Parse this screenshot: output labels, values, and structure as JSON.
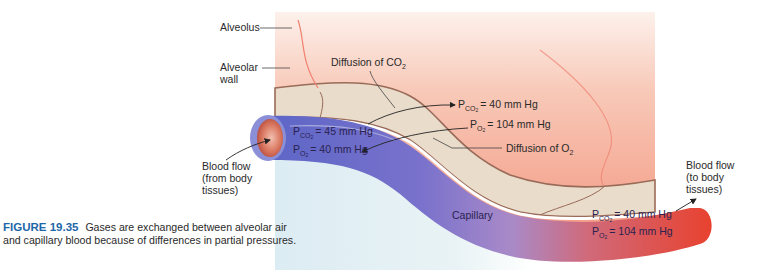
{
  "figure": {
    "number_label": "FIGURE 19.35",
    "caption_text": "Gases are exchanged between alveolar air and capillary blood because of differences in partial pressures."
  },
  "labels": {
    "alveolus": "Alveolus",
    "alveolar_wall_line1": "Alveolar",
    "alveolar_wall_line2": "wall",
    "diffusion_co2": "Diffusion of CO",
    "diffusion_o2": "Diffusion of O",
    "sub2": "2",
    "blood_flow_in_line1": "Blood flow",
    "blood_flow_in_line2": "(from body",
    "blood_flow_in_line3": "tissues)",
    "blood_flow_out_line1": "Blood flow",
    "blood_flow_out_line2": "(to body",
    "blood_flow_out_line3": "tissues)",
    "capillary": "Capillary"
  },
  "pressures": {
    "P": "P",
    "co2_sub": "CO",
    "o2_sub": "O",
    "sub2": "2",
    "alveolar_pco2": "= 40 mm Hg",
    "alveolar_po2": "= 104 mm Hg",
    "venous_pco2": "= 45 mm Hg",
    "venous_po2": "= 40 mm Hg",
    "arterial_pco2": "= 40 mm Hg",
    "arterial_po2": "= 104 mm Hg"
  },
  "colors": {
    "alveolus_pink": "#f4a48e",
    "wall_beige": "#e9dccb",
    "wall_outline": "#9a6b58",
    "deoxygenated_blue": "#6f6fc8",
    "oxygenated_red": "#e2453c",
    "tissue_lightblue": "#dceef2",
    "caption_blue": "#1d67a8"
  }
}
